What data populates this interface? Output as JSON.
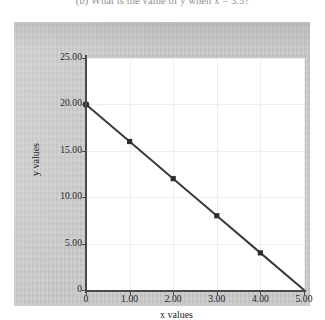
{
  "caption": {
    "text": "(b) What is the value of y when x = 3.5?"
  },
  "colors": {
    "line": "#3a3a3a",
    "marker": "#2e2e2e",
    "axis": "#4a4a4a",
    "grid": "#ededed",
    "plot_background": "#ffffff",
    "panel_background": "#c9c9c9",
    "tick_text": "#1d1d1d"
  },
  "chart_data": {
    "type": "line",
    "title": "",
    "xlabel": "x values",
    "ylabel": "y values",
    "xlim": [
      0,
      5
    ],
    "ylim": [
      0,
      25
    ],
    "grid": true,
    "legend": null,
    "x_ticks": [
      "0",
      "1.00",
      "2.00",
      "3.00",
      "4.00",
      "5.00"
    ],
    "x_tick_values": [
      0,
      1,
      2,
      3,
      4,
      5
    ],
    "y_ticks": [
      "0",
      "5.00",
      "10.00",
      "15.00",
      "20.00",
      "25.00"
    ],
    "y_tick_values": [
      0,
      5,
      10,
      15,
      20,
      25
    ],
    "series": [
      {
        "name": "y",
        "marker": "square",
        "x": [
          0,
          1,
          2,
          3,
          4,
          5
        ],
        "values": [
          20,
          16,
          12,
          8,
          4,
          0
        ]
      }
    ]
  }
}
